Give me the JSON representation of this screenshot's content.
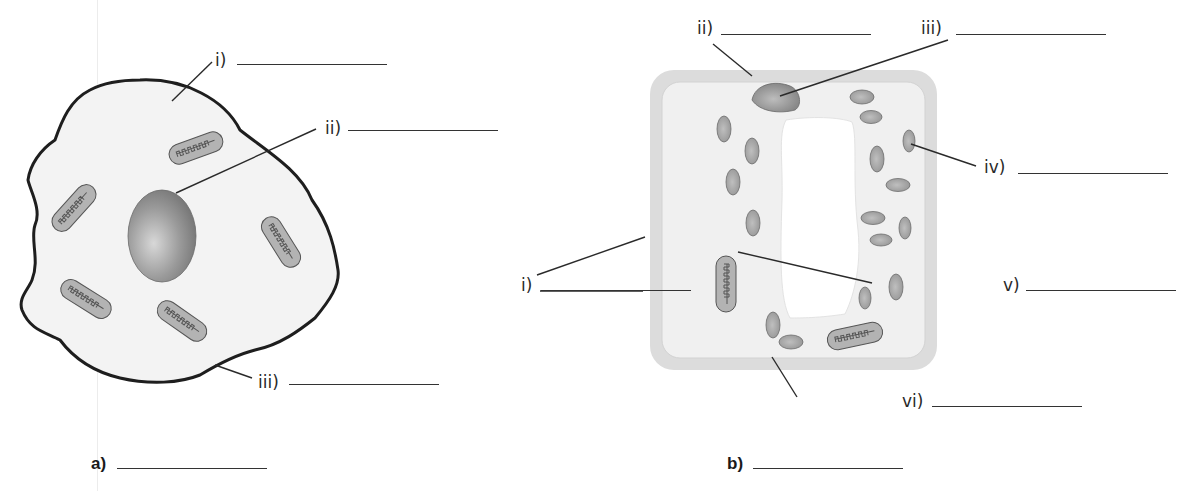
{
  "diagram": {
    "type": "cell-labelling-worksheet",
    "panels": [
      {
        "id": "a",
        "caption": "a)",
        "answer_blank": "",
        "shape": "irregular rounded cell",
        "labels": [
          {
            "id": "i",
            "text": "i)",
            "points_to": "cytoplasm",
            "answer": ""
          },
          {
            "id": "ii",
            "text": "ii)",
            "points_to": "nucleus",
            "answer": ""
          },
          {
            "id": "iii",
            "text": "iii)",
            "points_to": "outer boundary",
            "answer": ""
          }
        ],
        "organelle_counts": {
          "nucleus": 1,
          "mitochondria": 5
        }
      },
      {
        "id": "b",
        "caption": "b)",
        "answer_blank": "",
        "shape": "rectangular cell with wall",
        "labels": [
          {
            "id": "i",
            "text": "i)",
            "points_to": "cell wall and membrane (two pointer lines)",
            "answer": ""
          },
          {
            "id": "ii",
            "text": "ii)",
            "points_to": "outer wall layer",
            "answer": ""
          },
          {
            "id": "iii",
            "text": "iii)",
            "points_to": "nucleus",
            "answer": ""
          },
          {
            "id": "iv",
            "text": "iv)",
            "points_to": "chloroplast",
            "answer": ""
          },
          {
            "id": "v",
            "text": "v)",
            "points_to": "large central vacuole",
            "answer": ""
          },
          {
            "id": "vi",
            "text": "vi)",
            "points_to": "bottom boundary",
            "answer": ""
          }
        ],
        "organelle_counts": {
          "nucleus": 1,
          "mitochondria": 2,
          "chloroplasts": 18,
          "vacuole": 1
        }
      }
    ],
    "colors": {
      "background": "#ffffff",
      "cell_fill": "#f3f3f3",
      "outline": "#1e1e1e",
      "organelle_fill": "#a9a9a9",
      "wall_fill": "#dcdcdc",
      "vacuole_fill": "#ffffff",
      "leader_line": "#2a2a2a"
    }
  },
  "labels": {
    "a_i": "i)",
    "a_ii": "ii)",
    "a_iii": "iii)",
    "b_i": "i)",
    "b_ii": "ii)",
    "b_iii": "iii)",
    "b_iv": "iv)",
    "b_v": "v)",
    "b_vi": "vi)",
    "cap_a": "a)",
    "cap_b": "b)"
  }
}
